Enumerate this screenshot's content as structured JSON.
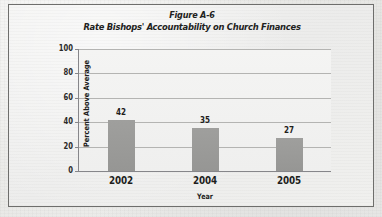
{
  "figure": {
    "title": "Figure A-6",
    "subtitle": "Rate Bishops' Accountability on Church Finances"
  },
  "chart_data": {
    "type": "bar",
    "title": "Rate Bishops' Accountability on Church Finances",
    "subtitle": "Figure A-6",
    "categories": [
      "2002",
      "2004",
      "2005"
    ],
    "values": [
      42,
      35,
      27
    ],
    "value_labels": [
      "42",
      "35",
      "27"
    ],
    "xlabel": "Year",
    "ylabel": "Percent Above Average",
    "ylim": [
      0,
      100
    ],
    "yticks": [
      0,
      20,
      40,
      60,
      80,
      100
    ],
    "ytick_labels": [
      "0",
      "20",
      "40",
      "60",
      "80",
      "100"
    ],
    "grid": true,
    "legend": false,
    "bar_color": "#9a9a98",
    "plot_background": "#f2f2f1",
    "axis_color": "#86868a",
    "grid_color": "#b4b4b2",
    "frame_color": "#6e6e6c"
  }
}
